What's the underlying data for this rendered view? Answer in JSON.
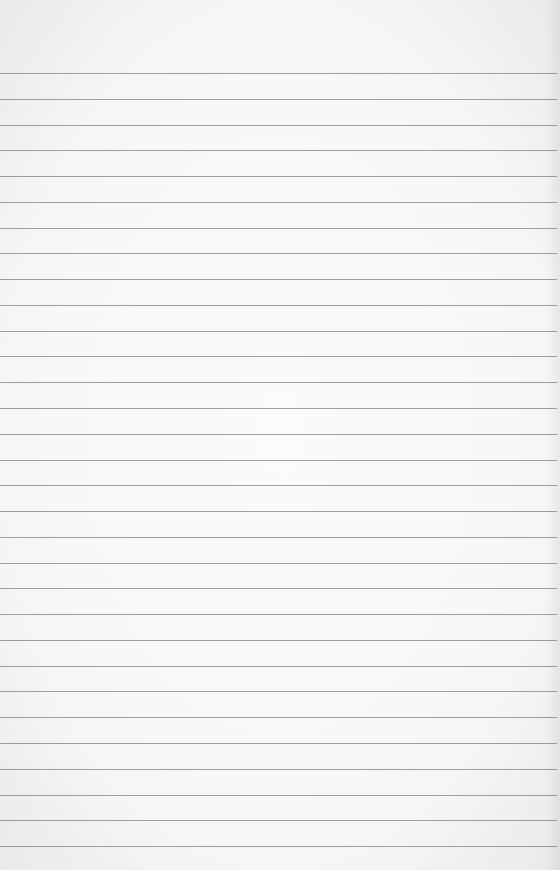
{
  "paper": {
    "type": "lined-paper",
    "background_color": "#f6f6f5",
    "rule_color": "#8d8d8d",
    "rules": {
      "count": 31,
      "first_y": 73,
      "spacing": 25.77
    },
    "text": ""
  }
}
